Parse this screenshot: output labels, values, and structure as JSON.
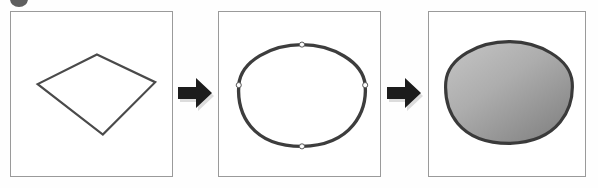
{
  "figure": {
    "background_color": "#fefefe",
    "width": 598,
    "height": 188
  },
  "corner_marker": {
    "name": "clipped-circle-artifact",
    "color": "#5f5f5f",
    "label": ""
  },
  "panels": [
    {
      "id": "panel-1",
      "caption": "",
      "step_label": "1",
      "content": "polygon-outline",
      "description": "Quadrilateral outline",
      "stroke_color": "#4a4a4a",
      "fill_color": "none",
      "stroke_width": "2.2",
      "points": "87,43 146,71 93,124 27,73",
      "border_color": "#9a9a9a",
      "background_color": "#ffffff"
    },
    {
      "id": "panel-2",
      "caption": "",
      "step_label": "2",
      "content": "smoothed-curve-with-control-points",
      "description": "Smoothed closed curve with control points",
      "stroke_color": "#3d3d3d",
      "fill_color": "none",
      "stroke_width": "3.4",
      "path": "M 84,33 C 114,33 146,50 148,74 C 150,100 135,135 84,136 C 33,136 18,103 20,74 C 22,49 54,33 84,33 Z",
      "control_points": [
        {
          "name": "control-point-top",
          "cx": 84,
          "cy": 33
        },
        {
          "name": "control-point-right",
          "cx": 148,
          "cy": 74
        },
        {
          "name": "control-point-bottom",
          "cx": 84,
          "cy": 136
        },
        {
          "name": "control-point-left",
          "cx": 20,
          "cy": 74
        }
      ],
      "control_point_fill": "#fdfdfd",
      "control_point_stroke": "#555555",
      "border_color": "#9a9a9a",
      "background_color": "#ffffff"
    },
    {
      "id": "panel-3",
      "caption": "",
      "step_label": "3",
      "content": "filled-gradient-shape",
      "description": "Smoothed shape filled with gray gradient",
      "stroke_color": "#3a3a3a",
      "stroke_width": "3.2",
      "path": "M 81,30 C 111,30 143,47 145,71 C 147,97 132,132 81,133 C 30,133 15,100 17,71 C 19,46 51,30 81,30 Z",
      "gradient": {
        "name": "shape-fill-gradient",
        "type": "linear",
        "from_color": "#c2c2c2",
        "to_color": "#848484",
        "angle_deg": 135
      },
      "border_color": "#9a9a9a",
      "background_color": "#ffffff"
    }
  ],
  "arrows": [
    {
      "id": "arrow-1",
      "name": "step-arrow-1-to-2",
      "direction": "right",
      "color": "#1c1c1c",
      "shadow_color": "#d8d8d8",
      "label": ""
    },
    {
      "id": "arrow-2",
      "name": "step-arrow-2-to-3",
      "direction": "right",
      "color": "#1c1c1c",
      "shadow_color": "#d8d8d8",
      "label": ""
    }
  ]
}
